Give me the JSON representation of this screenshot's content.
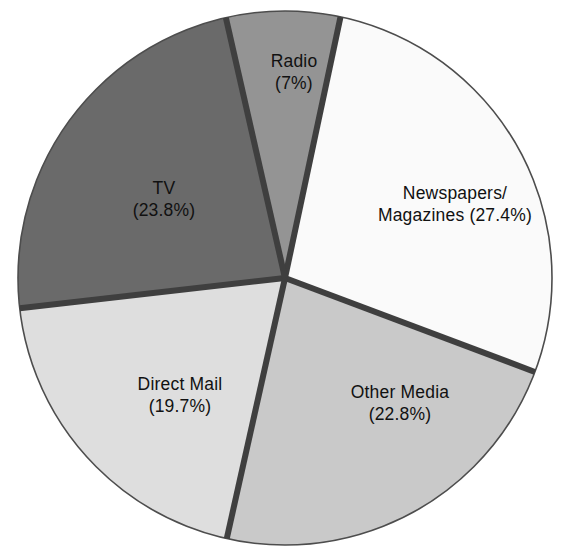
{
  "chart_data": {
    "type": "pie",
    "title": "",
    "subtitle": "",
    "xlabel": "",
    "ylabel": "",
    "legend_position": "none",
    "grid": false,
    "units": "percent",
    "total": 100.7,
    "start_angle_deg_clockwise_from_top": 12,
    "categories": [
      "Newspapers/ Magazines",
      "Other Media",
      "Direct Mail",
      "TV",
      "Radio"
    ],
    "values": [
      27.4,
      22.8,
      19.7,
      23.8,
      7.0
    ],
    "slices": [
      {
        "name": "Newspapers/ Magazines",
        "label_line1": "Newspapers/",
        "label_line2": "Magazines (27.4%)",
        "value": 27.4,
        "value_text": "(27.4%)",
        "color": "#fafafa",
        "start_deg": 12,
        "end_deg": 110.6,
        "label_x": 455,
        "label_y": 204
      },
      {
        "name": "Other Media",
        "label_line1": "Other Media",
        "label_line2": "(22.8%)",
        "value": 22.8,
        "value_text": "(22.8%)",
        "color": "#c9c9c9",
        "start_deg": 110.6,
        "end_deg": 192.6,
        "label_x": 400,
        "label_y": 403
      },
      {
        "name": "Direct Mail",
        "label_line1": "Direct Mail",
        "label_line2": "(19.7%)",
        "value": 19.7,
        "value_text": "(19.7%)",
        "color": "#dedede",
        "start_deg": 192.6,
        "end_deg": 263.5,
        "label_x": 180,
        "label_y": 395
      },
      {
        "name": "TV",
        "label_line1": "TV",
        "label_line2": "(23.8%)",
        "value": 23.8,
        "value_text": "(23.8%)",
        "color": "#6a6a6a",
        "start_deg": 263.5,
        "end_deg": 347.2,
        "label_x": 164,
        "label_y": 199
      },
      {
        "name": "Radio",
        "label_line1": "Radio",
        "label_line2": "(7%)",
        "value": 7.0,
        "value_text": "(7%)",
        "color": "#949494",
        "start_deg": 347.2,
        "end_deg": 372,
        "label_x": 294,
        "label_y": 72
      }
    ],
    "geometry": {
      "center_x": 285,
      "center_y": 278,
      "radius": 267
    },
    "style": {
      "separator_color": "#3f3f3f",
      "separator_width": 6,
      "outline_color": "#4d4d4d",
      "outline_width": 1.6,
      "background": "#ffffff",
      "label_color": "#111111"
    }
  }
}
